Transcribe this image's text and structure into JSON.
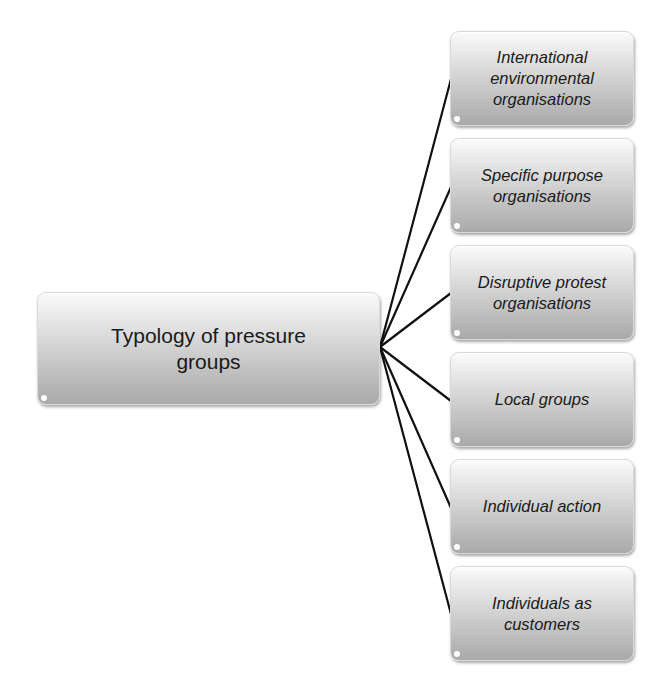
{
  "diagram": {
    "type": "hierarchy",
    "root": {
      "label": "Typology of pressure\ngroups"
    },
    "children": [
      {
        "label": "International\nenvironmental\norganisations"
      },
      {
        "label": "Specific purpose\norganisations"
      },
      {
        "label": "Disruptive protest\norganisations"
      },
      {
        "label": "Local groups"
      },
      {
        "label": "Individual action"
      },
      {
        "label": "Individuals as\ncustomers"
      }
    ],
    "colors": {
      "connector": "#111111",
      "box_top": "#fbfbfb",
      "box_bottom": "#a9a9a9",
      "text": "#1a1a1a"
    }
  }
}
